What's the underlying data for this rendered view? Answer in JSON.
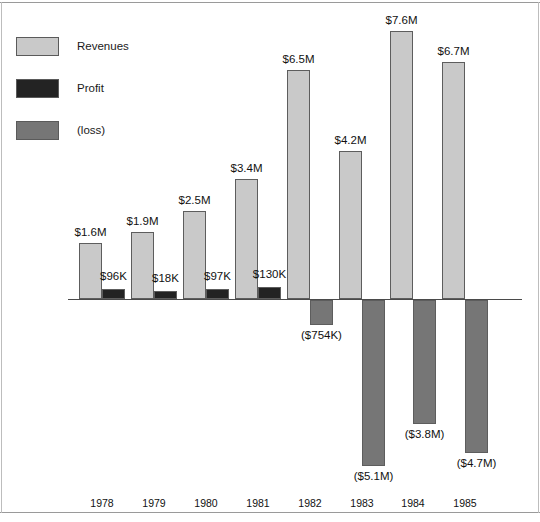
{
  "chart_data": {
    "type": "bar",
    "title": "",
    "subtitle": "",
    "xlabel": "",
    "ylabel": "",
    "grid": false,
    "legend_position": "top-left",
    "orientation": "vertical",
    "categories": [
      "1978",
      "1979",
      "1980",
      "1981",
      "1982",
      "1983",
      "1984",
      "1985"
    ],
    "ylim": [
      -5.1,
      7.6
    ],
    "units": "USD",
    "series": [
      {
        "name": "Revenues",
        "color": "#c9c9c9",
        "values": [
          1.6,
          1.9,
          2.5,
          3.4,
          6.5,
          4.2,
          7.6,
          6.7
        ],
        "labels": [
          "$1.6M",
          "$1.9M",
          "$2.5M",
          "$3.4M",
          "$6.5M",
          "$4.2M",
          "$7.6M",
          "$6.7M"
        ]
      },
      {
        "name": "Profit",
        "color": "#232323",
        "values": [
          0.096,
          0.018,
          0.097,
          0.13,
          null,
          null,
          null,
          null
        ],
        "labels": [
          "$96K",
          "$18K",
          "$97K",
          "$130K",
          "",
          "",
          "",
          ""
        ]
      },
      {
        "name": "(loss)",
        "color": "#767676",
        "values": [
          null,
          null,
          null,
          null,
          -0.754,
          -5.1,
          -3.8,
          -4.7
        ],
        "labels": [
          "",
          "",
          "",
          "",
          "($754K)",
          "($5.1M)",
          "($3.8M)",
          "($4.7M)"
        ]
      }
    ]
  },
  "legend": {
    "items": [
      {
        "label": "Revenues",
        "color": "#c9c9c9"
      },
      {
        "label": "Profit",
        "color": "#232323"
      },
      {
        "label": "(loss)",
        "color": "#767676"
      }
    ]
  },
  "axis": {
    "years": [
      "1978",
      "1979",
      "1980",
      "1981",
      "1982",
      "1983",
      "1984",
      "1985"
    ]
  },
  "values": {
    "revenue_labels": [
      "$1.6M",
      "$1.9M",
      "$2.5M",
      "$3.4M",
      "$6.5M",
      "$4.2M",
      "$7.6M",
      "$6.7M"
    ],
    "profit_labels": [
      "$96K",
      "$18K",
      "$97K",
      "$130K"
    ],
    "loss_labels": [
      "($754K)",
      "($5.1M)",
      "($3.8M)",
      "($4.7M)"
    ]
  },
  "colors": {
    "revenue": "#c9c9c9",
    "profit": "#232323",
    "loss": "#767676",
    "axis": "#4a4a4a",
    "border": "#5d5d5d"
  }
}
